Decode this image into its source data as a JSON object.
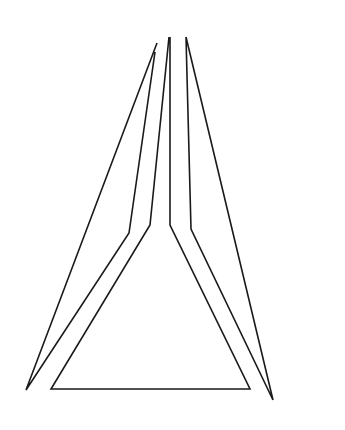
{
  "figure": {
    "width": 345,
    "height": 430,
    "background": "#ffffff",
    "stroke_color": "#1a1a1a",
    "stroke_width": 1.6,
    "pieces": [
      {
        "name": "left-sliver",
        "points": "157,43 26,390 129,233 155,52"
      },
      {
        "name": "center-triangle",
        "points": "169,37 150,225 51,389 250,389 170,225 170,37"
      },
      {
        "name": "right-sliver",
        "points": "186,37 191,229 273,400 186,37"
      }
    ]
  }
}
